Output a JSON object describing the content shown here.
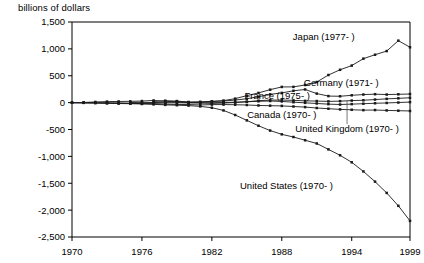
{
  "chart_data": {
    "type": "line",
    "title": "",
    "ylabel": "billions of dollars",
    "xlabel": "",
    "ylim": [
      -2500,
      1500
    ],
    "xlim": [
      1970,
      1999
    ],
    "grid": false,
    "legend_position": "inline-annotations",
    "ytick_labels": [
      "1,500",
      "1,000",
      "500",
      "0",
      "-500",
      "-1,000",
      "-1,500",
      "-2,000",
      "-2,500"
    ],
    "ytick_values": [
      1500,
      1000,
      500,
      0,
      -500,
      -1000,
      -1500,
      -2000,
      -2500
    ],
    "xtick_labels": [
      "1970",
      "1976",
      "1982",
      "1988",
      "1994",
      "1999"
    ],
    "xtick_values": [
      1970,
      1976,
      1982,
      1988,
      1994,
      1999
    ],
    "x": [
      1970,
      1971,
      1972,
      1973,
      1974,
      1975,
      1976,
      1977,
      1978,
      1979,
      1980,
      1981,
      1982,
      1983,
      1984,
      1985,
      1986,
      1987,
      1988,
      1989,
      1990,
      1991,
      1992,
      1993,
      1994,
      1995,
      1996,
      1997,
      1998,
      1999
    ],
    "series": [
      {
        "name": "Japan",
        "label": "Japan (1977- )",
        "start_year": 1977,
        "values": [
          null,
          null,
          null,
          null,
          null,
          null,
          null,
          22,
          36,
          29,
          12,
          11,
          25,
          37,
          74,
          130,
          180,
          241,
          292,
          293,
          328,
          383,
          514,
          611,
          689,
          818,
          891,
          959,
          1153,
          1030
        ],
        "label_x": 1991.6,
        "label_y": 1230,
        "label_anchor": "middle"
      },
      {
        "name": "Germany",
        "label": "Germany (1971- )",
        "start_year": 1971,
        "values": [
          null,
          3,
          12,
          19,
          22,
          24,
          29,
          40,
          25,
          14,
          4,
          13,
          19,
          30,
          48,
          72,
          110,
          154,
          181,
          220,
          245,
          168,
          122,
          118,
          136,
          150,
          157,
          150,
          155,
          160
        ],
        "label_x": 1993.1,
        "label_y": 370,
        "label_anchor": "middle"
      },
      {
        "name": "France",
        "label": "France (1975- )",
        "start_year": 1975,
        "values": [
          null,
          null,
          null,
          null,
          null,
          2,
          5,
          1,
          9,
          15,
          3,
          -5,
          -14,
          -8,
          2,
          16,
          36,
          47,
          48,
          42,
          33,
          29,
          23,
          27,
          38,
          44,
          57,
          70,
          80,
          90
        ],
        "label_x": 1987.6,
        "label_y": 135,
        "label_anchor": "middle"
      },
      {
        "name": "Canada",
        "label": "Canada (1970- )",
        "start_year": 1970,
        "values": [
          -1,
          -2,
          -3,
          -4,
          -6,
          -11,
          -17,
          -22,
          -29,
          -34,
          -36,
          -43,
          -37,
          -36,
          -39,
          -44,
          -53,
          -57,
          -61,
          -72,
          -83,
          -100,
          -113,
          -126,
          -133,
          -140,
          -138,
          -145,
          -150,
          -155
        ],
        "label_x": 1988.0,
        "label_y": -215,
        "label_anchor": "middle"
      },
      {
        "name": "United Kingdom",
        "label": "United Kingdom (1970- )",
        "start_year": 1970,
        "values": [
          -2,
          -3,
          -5,
          -8,
          -12,
          -14,
          -16,
          -9,
          -4,
          -2,
          -6,
          -5,
          -2,
          2,
          8,
          16,
          25,
          30,
          22,
          8,
          -4,
          -16,
          -28,
          -35,
          -28,
          -20,
          -12,
          -6,
          2,
          10
        ],
        "label_x": 1993.6,
        "label_y": -480,
        "label_anchor": "middle"
      },
      {
        "name": "United States",
        "label": "United States (1970- )",
        "start_year": 1970,
        "values": [
          -2,
          -4,
          -8,
          -13,
          -17,
          -20,
          -25,
          -32,
          -42,
          -48,
          -55,
          -70,
          -95,
          -145,
          -230,
          -330,
          -430,
          -520,
          -590,
          -640,
          -700,
          -760,
          -870,
          -980,
          -1110,
          -1280,
          -1470,
          -1680,
          -1920,
          -2200
        ],
        "label_x": 1988.4,
        "label_y": -1540,
        "label_anchor": "middle"
      }
    ]
  },
  "axis": {
    "y_title": "billions of dollars"
  }
}
